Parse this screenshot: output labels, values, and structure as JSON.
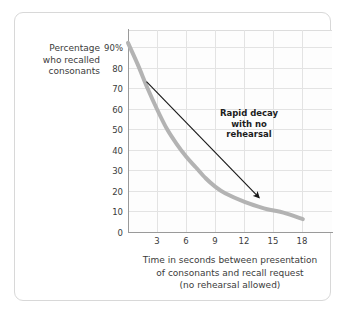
{
  "figure": {
    "y_axis_caption": [
      "Percentage",
      "who recalled",
      "consonants"
    ],
    "x_axis_caption": [
      "Time in seconds between presentation",
      "of consonants and recall request",
      "(no rehearsal allowed)"
    ],
    "annotation": [
      "Rapid decay",
      "with no",
      "rehearsal"
    ]
  },
  "colors": {
    "curve": "#b3b3b3",
    "arrow": "#1a1a1a",
    "grid": "#e3e3e3",
    "axis": "#9a9a9a",
    "card_border": "#d8d8d8",
    "text": "#3b3b3b",
    "plot_bg": "#fdfdfd"
  },
  "chart_data": {
    "type": "line",
    "title": "",
    "xlabel": "Time in seconds between presentation of consonants and recall request (no rehearsal allowed)",
    "ylabel": "Percentage who recalled consonants",
    "xlim": [
      0,
      21
    ],
    "ylim": [
      0,
      94
    ],
    "grid": true,
    "legend": "none",
    "xticks": [
      3,
      6,
      9,
      12,
      15,
      18
    ],
    "xticklabels": [
      "3",
      "6",
      "9",
      "12",
      "15",
      "18"
    ],
    "yticks": [
      0,
      10,
      20,
      30,
      40,
      50,
      60,
      70,
      80,
      90
    ],
    "yticklabels": [
      "0",
      "10",
      "20",
      "30",
      "40",
      "50",
      "60",
      "70",
      "80",
      "90%"
    ],
    "series": [
      {
        "name": "Percentage who recalled consonants",
        "color": "#b3b3b3",
        "linewidth": 4,
        "x": [
          0,
          1,
          2,
          3,
          4,
          5,
          6,
          7,
          8,
          9,
          10,
          12,
          14,
          15,
          16,
          18
        ],
        "values": [
          88,
          78,
          67,
          57,
          48,
          41,
          35,
          30,
          25,
          21,
          18,
          14,
          11,
          10,
          9,
          6
        ]
      }
    ],
    "annotations": [
      {
        "text": "Rapid decay with no rehearsal",
        "arrow_from_data": [
          1.9,
          70
        ],
        "arrow_to_data": [
          13.5,
          16
        ]
      }
    ]
  }
}
